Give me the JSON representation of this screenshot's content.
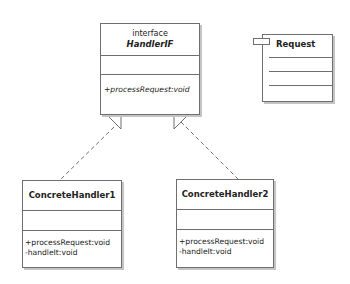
{
  "diagram": {
    "type": "UML class diagram",
    "pattern": "Chain of Responsibility",
    "colors": {
      "stroke": "#6f6f6f",
      "shadow": "#c4c4c4",
      "text": "#222222",
      "background": "#ffffff"
    }
  },
  "classes": {
    "handler_if": {
      "stereotype": "interface",
      "name": "HandlerIF",
      "attributes": [],
      "operations": [
        "+processRequest:void"
      ]
    },
    "concrete_handler_1": {
      "name": "ConcreteHandler1",
      "attributes": [],
      "operations": [
        "+processRequest:void",
        "-handleIt:void"
      ]
    },
    "concrete_handler_2": {
      "name": "ConcreteHandler2",
      "attributes": [],
      "operations": [
        "+processRequest:void",
        "-handleIt:void"
      ]
    },
    "request": {
      "name": "Request",
      "icon": "component-tab-icon"
    }
  },
  "relationships": [
    {
      "from": "ConcreteHandler1",
      "to": "HandlerIF",
      "type": "realization",
      "style": "dashed",
      "arrowhead": "hollow-triangle"
    },
    {
      "from": "ConcreteHandler2",
      "to": "HandlerIF",
      "type": "realization",
      "style": "dashed",
      "arrowhead": "hollow-triangle"
    }
  ]
}
